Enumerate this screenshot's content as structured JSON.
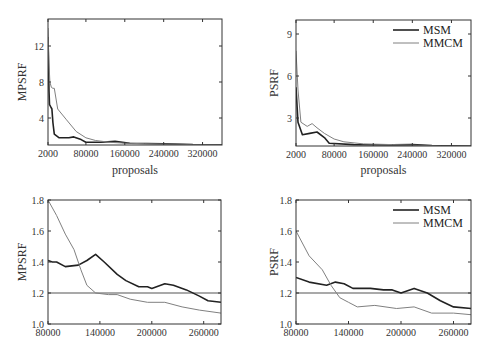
{
  "chart_data": [
    {
      "id": "top-left",
      "type": "line",
      "title": "",
      "xlabel": "proposals",
      "ylabel": "MPSRF",
      "xlim": [
        2000,
        360000
      ],
      "ylim": [
        1,
        15
      ],
      "xticks": [
        2000,
        80000,
        160000,
        240000,
        320000
      ],
      "xtick_labels": [
        "2000",
        "80000",
        "160000",
        "240000",
        "320000"
      ],
      "yticks": [
        4,
        8,
        12
      ],
      "ytick_labels": [
        "4",
        "8",
        "12"
      ],
      "grid": false,
      "legend": false,
      "series": [
        {
          "name": "MSM",
          "x": [
            2000,
            4000,
            5000,
            8000,
            10000,
            12000,
            15000,
            25000,
            45000,
            55000,
            70000,
            80000,
            110000,
            140000,
            170000,
            240000,
            300000,
            360000
          ],
          "y": [
            13,
            7,
            5.5,
            5.2,
            5,
            3.5,
            2.2,
            1.8,
            1.8,
            1.9,
            1.6,
            1.3,
            1.3,
            1.4,
            1.2,
            1.15,
            1.05,
            1.03
          ]
        },
        {
          "name": "MMCM",
          "x": [
            2000,
            4000,
            6000,
            9000,
            12000,
            15000,
            22000,
            40000,
            60000,
            80000,
            100000,
            130000,
            160000,
            200000,
            240000,
            300000,
            360000
          ],
          "y": [
            14,
            10,
            8,
            7.4,
            7.3,
            7.3,
            5,
            3.8,
            2.5,
            1.8,
            1.5,
            1.3,
            1.2,
            1.15,
            1.1,
            1.05,
            1.02
          ]
        }
      ]
    },
    {
      "id": "top-right",
      "type": "line",
      "title": "",
      "xlabel": "proposals",
      "ylabel": "PSRF",
      "xlim": [
        2000,
        360000
      ],
      "ylim": [
        1,
        10
      ],
      "xticks": [
        2000,
        80000,
        160000,
        240000,
        320000
      ],
      "xtick_labels": [
        "2000",
        "80000",
        "160000",
        "240000",
        "320000"
      ],
      "yticks": [
        3,
        6,
        9
      ],
      "ytick_labels": [
        "3",
        "6",
        "9"
      ],
      "grid": false,
      "legend": true,
      "legend_position": "upper right",
      "series": [
        {
          "name": "MSM",
          "x": [
            2000,
            6000,
            15000,
            30000,
            45000,
            60000,
            70000,
            120000,
            200000,
            240000,
            280000,
            360000
          ],
          "y": [
            5.2,
            2.7,
            1.8,
            1.9,
            2.0,
            1.6,
            1.2,
            1.1,
            1.08,
            1.1,
            1.03,
            1.0
          ]
        },
        {
          "name": "MMCM",
          "x": [
            2000,
            6000,
            12000,
            25000,
            35000,
            45000,
            60000,
            80000,
            100000,
            140000,
            200000,
            250000,
            300000,
            360000
          ],
          "y": [
            7.8,
            5,
            2.7,
            2.4,
            2.6,
            2.3,
            1.9,
            1.5,
            1.3,
            1.15,
            1.1,
            1.05,
            1.0,
            1.0
          ]
        }
      ]
    },
    {
      "id": "bottom-left",
      "type": "line",
      "title": "",
      "xlabel": "",
      "ylabel": "MPSRF",
      "xlim": [
        80000,
        280000
      ],
      "ylim": [
        1.0,
        1.8
      ],
      "xticks": [
        80000,
        140000,
        200000,
        260000
      ],
      "xtick_labels": [
        "80000",
        "140000",
        "200000",
        "260000"
      ],
      "yticks": [
        1.0,
        1.2,
        1.4,
        1.6,
        1.8
      ],
      "ytick_labels": [
        "1.0",
        "1.2",
        "1.4",
        "1.6",
        "1.8"
      ],
      "grid": false,
      "legend": false,
      "reference_line": 1.2,
      "series": [
        {
          "name": "MSM",
          "x": [
            80000,
            85000,
            90000,
            100000,
            115000,
            125000,
            135000,
            145000,
            160000,
            170000,
            185000,
            195000,
            200000,
            215000,
            225000,
            240000,
            255000,
            265000,
            280000
          ],
          "y": [
            1.41,
            1.4,
            1.4,
            1.37,
            1.38,
            1.41,
            1.45,
            1.4,
            1.32,
            1.28,
            1.24,
            1.24,
            1.23,
            1.26,
            1.25,
            1.22,
            1.18,
            1.15,
            1.14
          ]
        },
        {
          "name": "MMCM",
          "x": [
            80000,
            90000,
            100000,
            110000,
            118000,
            125000,
            135000,
            150000,
            160000,
            175000,
            195000,
            215000,
            235000,
            255000,
            280000
          ],
          "y": [
            1.8,
            1.7,
            1.58,
            1.48,
            1.35,
            1.25,
            1.2,
            1.19,
            1.19,
            1.16,
            1.14,
            1.14,
            1.11,
            1.09,
            1.07
          ]
        }
      ]
    },
    {
      "id": "bottom-right",
      "type": "line",
      "title": "",
      "xlabel": "",
      "ylabel": "PSRF",
      "xlim": [
        80000,
        280000
      ],
      "ylim": [
        1.0,
        1.8
      ],
      "xticks": [
        80000,
        140000,
        200000,
        260000
      ],
      "xtick_labels": [
        "80000",
        "140000",
        "200000",
        "260000"
      ],
      "yticks": [
        1.0,
        1.2,
        1.4,
        1.6,
        1.8
      ],
      "ytick_labels": [
        "1.0",
        "1.2",
        "1.4",
        "1.6",
        "1.8"
      ],
      "grid": false,
      "legend": true,
      "legend_position": "upper right",
      "reference_line": 1.2,
      "series": [
        {
          "name": "MSM",
          "x": [
            80000,
            95000,
            115000,
            125000,
            135000,
            145000,
            165000,
            180000,
            190000,
            200000,
            215000,
            230000,
            245000,
            260000,
            280000
          ],
          "y": [
            1.3,
            1.27,
            1.25,
            1.27,
            1.26,
            1.23,
            1.23,
            1.22,
            1.22,
            1.2,
            1.23,
            1.2,
            1.15,
            1.11,
            1.1
          ]
        },
        {
          "name": "MMCM",
          "x": [
            80000,
            95000,
            110000,
            120000,
            130000,
            140000,
            150000,
            170000,
            195000,
            215000,
            235000,
            260000,
            280000
          ],
          "y": [
            1.6,
            1.44,
            1.35,
            1.25,
            1.17,
            1.14,
            1.11,
            1.12,
            1.1,
            1.11,
            1.07,
            1.07,
            1.06
          ]
        }
      ]
    }
  ],
  "legend": {
    "msm_label": "MSM",
    "mmcm_label": "MMCM"
  },
  "colors": {
    "MSM": "#222222",
    "MMCM": "#808080",
    "axis": "#333333",
    "reference": "#555555"
  }
}
